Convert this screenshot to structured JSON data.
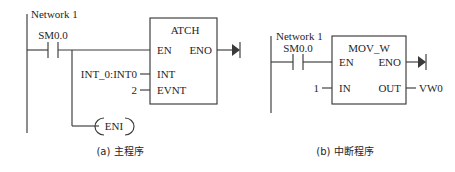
{
  "figure": {
    "type": "plc-ladder-logic-diagram",
    "panels": [
      {
        "id": "panel-a",
        "caption": "(a) 主程序",
        "network_label": "Network 1",
        "contact": {
          "label": "SM0.0",
          "kind": "normally-open-contact"
        },
        "block": {
          "name": "ATCH",
          "pins_left": [
            "EN",
            "INT",
            "EVNT"
          ],
          "pins_right": [
            "ENO"
          ]
        },
        "operands": [
          {
            "pin": "INT",
            "value": "INT_0:INT0"
          },
          {
            "pin": "EVNT",
            "value": "2"
          }
        ],
        "coil": {
          "label": "ENI",
          "kind": "coil"
        }
      },
      {
        "id": "panel-b",
        "caption": "(b) 中断程序",
        "network_label": "Network 1",
        "contact": {
          "label": "SM0.0",
          "kind": "normally-open-contact"
        },
        "block": {
          "name": "MOV_W",
          "pins_left": [
            "EN",
            "IN"
          ],
          "pins_right": [
            "ENO",
            "OUT"
          ]
        },
        "operands": [
          {
            "pin": "IN",
            "value": "1"
          },
          {
            "pin": "OUT",
            "value": "VW0"
          }
        ]
      }
    ],
    "colors": {
      "line": "#3a3a3a",
      "text": "#262626",
      "background": "#ffffff"
    }
  }
}
